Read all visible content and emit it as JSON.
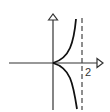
{
  "diagram": {
    "type": "function-graph",
    "asymptote_label": "2",
    "colors": {
      "axis": "#333333",
      "curve": "#111111",
      "asymptote": "#444444",
      "background": "#ffffff"
    },
    "elements": {
      "x_axis": {
        "arrow": true
      },
      "y_axis": {
        "arrow": true
      },
      "asymptote": {
        "x_value": 2,
        "style": "dashed"
      },
      "curve": {
        "branches": [
          "upper",
          "lower"
        ],
        "cusp_at": "origin"
      }
    }
  }
}
